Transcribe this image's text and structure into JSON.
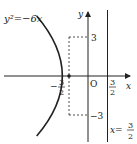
{
  "diagram": {
    "curve_label": "y²=−6x",
    "axis_x_label": "x",
    "axis_y_label": "y",
    "origin_label": "O",
    "tick_y_pos": "3",
    "tick_y_neg": "−3",
    "tick_x_neg_sign": "−",
    "tick_x_neg_num": "3",
    "tick_x_neg_den": "2",
    "tick_x_pos_num": "3",
    "tick_x_pos_den": "2",
    "directrix_label_prefix": "x=",
    "directrix_num": "3",
    "directrix_den": "2",
    "colors": {
      "stroke": "#222222",
      "background": "#ffffff"
    }
  }
}
